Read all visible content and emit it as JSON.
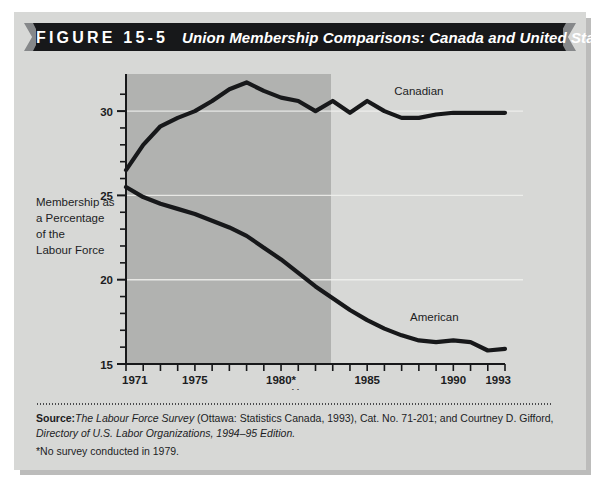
{
  "figure": {
    "number": "FIGURE  15-5",
    "title": "Union Membership Comparisons: Canada and United States"
  },
  "source": {
    "label": "Source:",
    "line1_italic": "The Labour Force Survey",
    "line1_normal": " (Ottawa: Statistics Canada, 1993), Cat. No. 71-201; and Courtney D. Gifford,",
    "line2_italic": "Directory of U.S. Labor Organizations, 1994–95 Edition.",
    "footnote": "*No survey conducted in 1979."
  },
  "colors": {
    "panel": "#d7d8d6",
    "plot_background": "#b1b2b0",
    "line": "#17181a",
    "ribbon": "#17181a",
    "ribbon_cap": "#86888a",
    "gridline": "#f2f2ef",
    "axis": "#17181a",
    "text": "#1c1d1f"
  },
  "chart_data": {
    "type": "line",
    "title": "Union Membership Comparisons: Canada and United States",
    "xlabel": "Years",
    "ylabel": "Membership as a Percentage of the Labour Force",
    "ylabel_lines": [
      "Membership as",
      "a Percentage",
      "of the",
      "Labour Force"
    ],
    "xlim": [
      1971,
      1993
    ],
    "ylim": [
      15,
      32.2
    ],
    "ytick_labels": [
      "15",
      "20",
      "25",
      "30"
    ],
    "yticks": [
      15,
      20,
      25,
      30
    ],
    "yticks_minor": [
      16,
      17,
      18,
      19,
      21,
      22,
      23,
      24,
      26,
      27,
      28,
      29,
      31
    ],
    "xticks": [
      1971,
      1972,
      1973,
      1974,
      1975,
      1976,
      1977,
      1978,
      1979,
      1980,
      1981,
      1982,
      1983,
      1984,
      1985,
      1986,
      1987,
      1988,
      1989,
      1990,
      1991,
      1992,
      1993
    ],
    "xtick_labels": [
      {
        "x": 1971,
        "label": "1971"
      },
      {
        "x": 1975,
        "label": "1975"
      },
      {
        "x": 1980,
        "label": "1980*"
      },
      {
        "x": 1985,
        "label": "1985"
      },
      {
        "x": 1990,
        "label": "1990"
      },
      {
        "x": 1993,
        "label": "1993"
      }
    ],
    "gridlines": [
      30,
      25,
      20
    ],
    "grid": "horizontal-white",
    "legend_position": "inline-annotations",
    "x": [
      1971,
      1972,
      1973,
      1974,
      1975,
      1976,
      1977,
      1978,
      1979,
      1980,
      1981,
      1982,
      1983,
      1984,
      1985,
      1986,
      1987,
      1988,
      1989,
      1990,
      1991,
      1992,
      1993
    ],
    "series": [
      {
        "name": "Canadian",
        "label": "Canadian",
        "values": [
          26.5,
          28.0,
          29.1,
          29.6,
          30.0,
          30.6,
          31.3,
          31.7,
          31.2,
          30.8,
          30.6,
          30.0,
          30.6,
          29.9,
          30.6,
          30.0,
          29.6,
          29.6,
          29.8,
          29.9,
          29.9,
          29.9,
          29.9
        ]
      },
      {
        "name": "American",
        "label": "American",
        "values": [
          25.5,
          24.9,
          24.5,
          24.2,
          23.9,
          23.5,
          23.1,
          22.6,
          21.9,
          21.2,
          20.4,
          19.6,
          18.9,
          18.2,
          17.6,
          17.1,
          16.7,
          16.4,
          16.3,
          16.4,
          16.3,
          15.8,
          15.9
        ]
      }
    ]
  }
}
